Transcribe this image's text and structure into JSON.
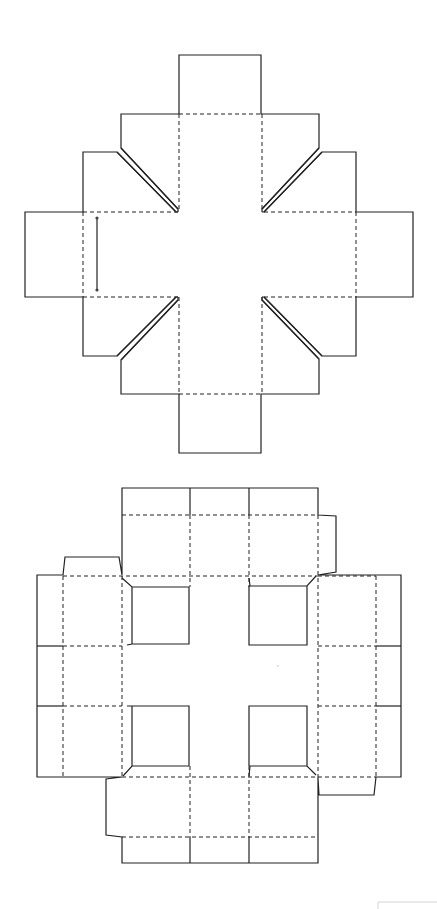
{
  "diagram": {
    "type": "box-dieline-templates",
    "colors": {
      "background": "#ffffff",
      "line": "#222222",
      "faint_frame": "#d6d6d6"
    },
    "legend_implied": {
      "solid_line": "cut",
      "dashed_line": "fold"
    },
    "templates": [
      {
        "id": "cross-lid-net",
        "description": "Cross-shaped net with four tabs and four diagonal corner slots; glue line on left panel",
        "bounds": {
          "x": [
            25,
            413
          ],
          "y": [
            55,
            453
          ]
        }
      },
      {
        "id": "tray-box-net",
        "description": "Grid tray net with four square window cut-outs, folding panels and glue tabs",
        "bounds": {
          "x": [
            37,
            401
          ],
          "y": [
            488,
            863
          ]
        }
      }
    ]
  }
}
